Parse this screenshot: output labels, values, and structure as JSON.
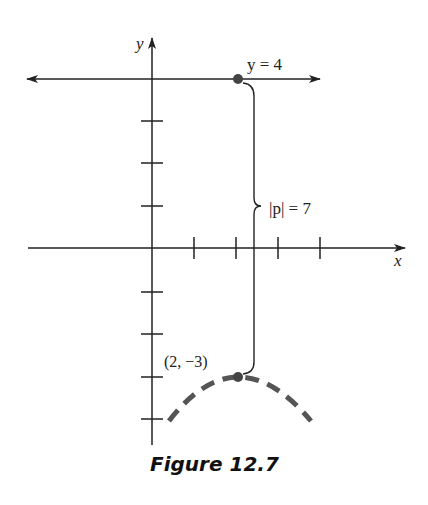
{
  "figure": {
    "caption": "Figure 12.7",
    "axes": {
      "x_label": "x",
      "y_label": "y",
      "x_ticks": [
        1,
        2,
        3,
        4
      ],
      "y_ticks": [
        -4,
        -3,
        -2,
        -1,
        1,
        2,
        3
      ]
    },
    "directrix": {
      "label": "y = 4",
      "y": 4
    },
    "point_on_directrix": {
      "x": 2,
      "y": 4
    },
    "vertex": {
      "label": "(2, −3)",
      "x": 2,
      "y": -3
    },
    "distance": {
      "label": "|p| = 7"
    },
    "parabola": {
      "style": "dashed",
      "opens": "down",
      "color": "#555555"
    },
    "colors": {
      "ink": "#222222",
      "curve": "#555555",
      "point": "#444444"
    }
  }
}
